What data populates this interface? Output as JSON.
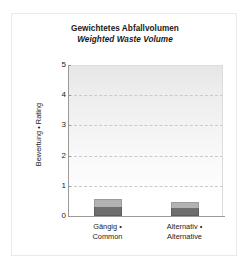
{
  "chart_data": {
    "type": "bar",
    "title": "Gewichtetes Abfallvolumen",
    "subtitle": "Weighted Waste Volume",
    "xlabel": "",
    "ylabel": "Bewertung • Rating",
    "ylim": [
      0,
      5
    ],
    "yticks": [
      "0",
      "1",
      "2",
      "3",
      "4",
      "5"
    ],
    "grid": true,
    "legend": "none",
    "stacked": true,
    "categories": [
      "Gängig • Common",
      "Alternativ • Alternative"
    ],
    "category_lines": [
      [
        "Gängig •",
        "Common"
      ],
      [
        "Alternativ •",
        "Alternative"
      ]
    ],
    "series": [
      {
        "name": "lower",
        "color": "#6e6e6e",
        "values": [
          0.3,
          0.27
        ]
      },
      {
        "name": "upper",
        "color": "#b2b2b2",
        "values": [
          0.27,
          0.18
        ]
      }
    ],
    "totals": [
      0.57,
      0.45
    ]
  },
  "colors": {
    "plot_background_top": "#e6e6e6",
    "plot_background_bottom": "#ffffff",
    "gridline": "#c9c9c9",
    "axis": "#9a9a9a",
    "card_border": "#e9e9e9",
    "text": "#1a1a1a"
  }
}
